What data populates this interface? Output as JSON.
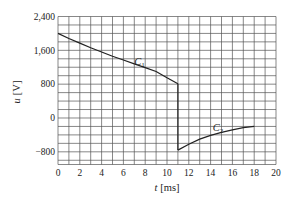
{
  "chart_data": {
    "type": "line",
    "title": "",
    "xlabel": "t [ms]",
    "ylabel": "u [V]",
    "xlim": [
      0,
      20
    ],
    "ylim": [
      -1100,
      2400
    ],
    "x_ticks": [
      0,
      2,
      4,
      6,
      8,
      10,
      12,
      14,
      16,
      18,
      20
    ],
    "x_tick_labels": [
      "0",
      "2",
      "4",
      "6",
      "8",
      "10",
      "12",
      "14",
      "16",
      "18",
      "20"
    ],
    "y_ticks": [
      2400,
      1600,
      800,
      0,
      -800
    ],
    "y_tick_labels": [
      "2,400",
      "1,600",
      "800",
      "0",
      "−800"
    ],
    "grid": true,
    "grid_x_step": 1,
    "grid_y_step": 200,
    "legend": null,
    "series": [
      {
        "name": "C1",
        "x": [
          0,
          1,
          2,
          3,
          4,
          5,
          6,
          7,
          8,
          9,
          10,
          11
        ],
        "values": [
          2000,
          1880,
          1770,
          1660,
          1560,
          1460,
          1370,
          1280,
          1190,
          1100,
          950,
          810
        ]
      },
      {
        "name": "jump",
        "x": [
          11,
          11
        ],
        "values": [
          810,
          -760
        ]
      },
      {
        "name": "C2",
        "x": [
          11,
          12,
          13,
          14,
          15,
          16,
          17,
          18
        ],
        "values": [
          -760,
          -620,
          -500,
          -410,
          -340,
          -280,
          -230,
          -200
        ]
      }
    ],
    "annotations": [
      {
        "text": "C1",
        "x": 7.0,
        "y": 1250
      },
      {
        "text": "C2",
        "x": 14.2,
        "y": -300
      }
    ]
  },
  "labels": {
    "xlabel_italic": "t",
    "xlabel_unit": "[ms]",
    "ylabel_italic": "u",
    "ylabel_unit": "[V]",
    "c1": "C",
    "c1_sub": "1",
    "c2": "C",
    "c2_sub": "2"
  }
}
